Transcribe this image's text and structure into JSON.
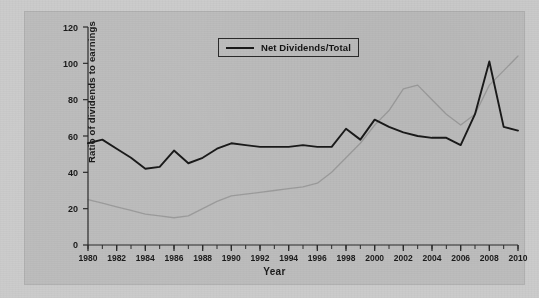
{
  "chart_data": {
    "type": "line",
    "title": "",
    "xlabel": "Year",
    "ylabel": "Ratio of dividends to earnings",
    "xlim": [
      1980,
      2010
    ],
    "ylim": [
      0,
      120
    ],
    "ytick_labels": [
      "0",
      "20",
      "40",
      "60",
      "80",
      "100",
      "120"
    ],
    "ytick_values": [
      0,
      20,
      40,
      60,
      80,
      100,
      120
    ],
    "xtick_labels": [
      "1980",
      "1982",
      "1984",
      "1986",
      "1988",
      "1990",
      "1992",
      "1994",
      "1996",
      "1998",
      "2000",
      "2002",
      "2004",
      "2006",
      "2008",
      "2010"
    ],
    "xtick_values": [
      1980,
      1982,
      1984,
      1986,
      1988,
      1990,
      1992,
      1994,
      1996,
      1998,
      2000,
      2002,
      2004,
      2006,
      2008,
      2010
    ],
    "minor_xticks_every": 1,
    "grid": false,
    "legend_position": "top-center",
    "legend": [
      "Net Dividends/Total"
    ],
    "x": [
      1980,
      1981,
      1982,
      1983,
      1984,
      1985,
      1986,
      1987,
      1988,
      1989,
      1990,
      1991,
      1992,
      1993,
      1994,
      1995,
      1996,
      1997,
      1998,
      1999,
      2000,
      2001,
      2002,
      2003,
      2004,
      2005,
      2006,
      2007,
      2008,
      2009,
      2010
    ],
    "series": [
      {
        "name": "Net Dividends/Total",
        "color": "#1a1a1a",
        "values": [
          56,
          58,
          53,
          48,
          42,
          43,
          52,
          45,
          48,
          53,
          56,
          55,
          54,
          54,
          54,
          55,
          54,
          54,
          64,
          58,
          69,
          65,
          62,
          60,
          59,
          59,
          55,
          72,
          101,
          65,
          63
        ]
      },
      {
        "name": "faint-bleedthrough-line",
        "color": "rgba(90,90,90,0.30)",
        "visible_as": "faint ghost line from reverse page",
        "values": [
          25,
          23,
          21,
          19,
          17,
          16,
          15,
          16,
          20,
          24,
          27,
          28,
          29,
          30,
          31,
          32,
          34,
          40,
          48,
          56,
          66,
          74,
          86,
          88,
          80,
          72,
          66,
          72,
          88,
          96,
          104
        ]
      }
    ]
  },
  "legend": {
    "label": "Net Dividends/Total"
  },
  "axes": {
    "ylabel": "Ratio of dividends to earnings",
    "xlabel": "Year"
  }
}
